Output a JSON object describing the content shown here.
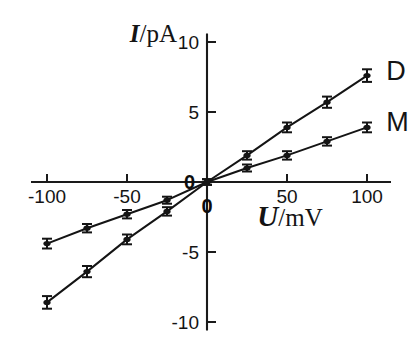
{
  "chart_data": {
    "type": "line",
    "title": "",
    "subtitle": "",
    "xlabel": "U/mV",
    "ylabel": "I/pA",
    "xlabel_italic": "U",
    "xlabel_rest": "/mV",
    "ylabel_italic": "I",
    "ylabel_rest": "/pA",
    "xlim": [
      -110,
      115
    ],
    "ylim": [
      -10.6,
      10.6
    ],
    "xticks": [
      -100,
      -50,
      0,
      50,
      100
    ],
    "xticklabels": [
      "-100",
      "-50",
      "0",
      "50",
      "100"
    ],
    "yticks": [
      10,
      5,
      0,
      -5,
      -10
    ],
    "yticklabels": [
      "10",
      "5",
      "0",
      "-5",
      "-10"
    ],
    "grid": false,
    "legend_position": "right-inline",
    "axes_style": "centered-cross",
    "x": [
      -100,
      -75,
      -50,
      -25,
      0,
      25,
      50,
      75,
      100
    ],
    "series": [
      {
        "name": "D",
        "label": "D",
        "color": "#141414",
        "values": [
          -8.6,
          -6.4,
          -4.1,
          -2.1,
          0,
          1.9,
          3.9,
          5.7,
          7.6
        ],
        "errors": [
          0.45,
          0.4,
          0.35,
          0.3,
          0.2,
          0.3,
          0.35,
          0.4,
          0.45
        ]
      },
      {
        "name": "M",
        "label": "M",
        "color": "#141414",
        "values": [
          -4.4,
          -3.3,
          -2.3,
          -1.3,
          0,
          1.0,
          1.9,
          2.9,
          3.9
        ],
        "errors": [
          0.35,
          0.3,
          0.3,
          0.25,
          0.2,
          0.25,
          0.3,
          0.3,
          0.35
        ]
      }
    ],
    "annotations": [
      {
        "text": "D",
        "x": 112,
        "y": 7.9
      },
      {
        "text": "M",
        "x": 112,
        "y": 4.3
      }
    ]
  }
}
